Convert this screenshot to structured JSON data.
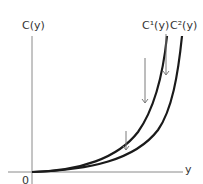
{
  "diagram": {
    "labels": {
      "y_axis": "C(y)",
      "x_axis": "y",
      "origin": "0",
      "curve1": "C¹(y)",
      "curve2": "C²(y)"
    },
    "colors": {
      "axis": "#8a8a8a",
      "curve": "#1a1a1a",
      "arrow": "#7a7a7a",
      "text": "#333333"
    },
    "elements": {
      "curves": [
        "C1 (steeper convex cost curve)",
        "C2 (flatter convex cost curve)"
      ],
      "arrows": 3
    }
  }
}
